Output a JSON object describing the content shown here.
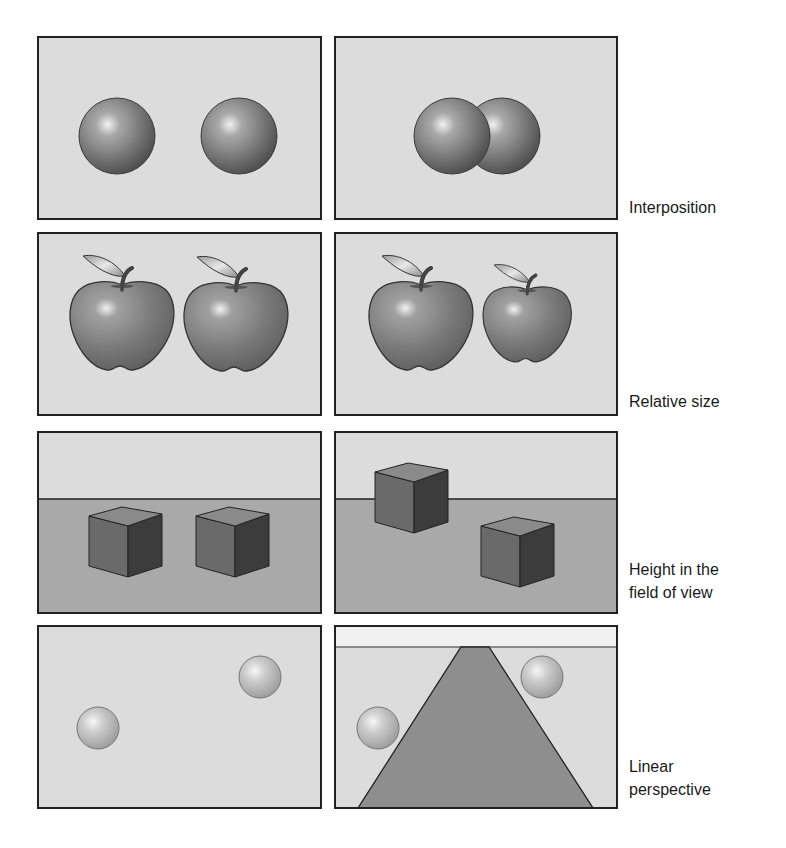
{
  "figure": {
    "colors": {
      "panel_bg": "#dcdcdc",
      "panel_border": "#222222",
      "ground": "#a9a9a9",
      "sky_strip": "#f0f0f0",
      "road": "#8e8e8e",
      "cube_top": "#8a8a8a",
      "cube_left": "#6a6a6a",
      "cube_right": "#3c3c3c",
      "label_text": "#1a1a1a"
    },
    "rows": [
      {
        "id": "interposition",
        "label_lines": [
          "Interposition"
        ],
        "left_panel": {
          "x": 38,
          "y": 37,
          "w": 283,
          "h": 182,
          "spheres": [
            {
              "cx": 117,
              "cy": 136,
              "r": 38
            },
            {
              "cx": 239,
              "cy": 136,
              "r": 38
            }
          ]
        },
        "right_panel": {
          "x": 335,
          "y": 37,
          "w": 282,
          "h": 182,
          "spheres": [
            {
              "cx": 502,
              "cy": 136,
              "r": 38
            },
            {
              "cx": 452,
              "cy": 136,
              "r": 38
            }
          ]
        }
      },
      {
        "id": "relative-size",
        "label_lines": [
          "Relative size"
        ],
        "left_panel": {
          "x": 38,
          "y": 233,
          "w": 283,
          "h": 182,
          "apples": [
            {
              "x": 70,
              "y": 256,
              "scale": 1.0
            },
            {
              "x": 184,
              "y": 257,
              "scale": 1.0
            }
          ]
        },
        "right_panel": {
          "x": 335,
          "y": 233,
          "w": 282,
          "h": 182,
          "apples": [
            {
              "x": 369,
              "y": 256,
              "scale": 1.0
            },
            {
              "x": 483,
              "y": 265,
              "scale": 0.85
            }
          ]
        }
      },
      {
        "id": "height-in-field",
        "label_lines": [
          "Height in the",
          "field of view"
        ],
        "left_panel": {
          "x": 38,
          "y": 432,
          "w": 283,
          "h": 181,
          "horizon_y": 499,
          "cubes": [
            {
              "x": 89,
              "y": 507
            },
            {
              "x": 196,
              "y": 507
            }
          ]
        },
        "right_panel": {
          "x": 335,
          "y": 432,
          "w": 282,
          "h": 181,
          "horizon_y": 499,
          "cubes": [
            {
              "x": 375,
              "y": 463
            },
            {
              "x": 481,
              "y": 517
            }
          ]
        }
      },
      {
        "id": "linear-perspective",
        "label_lines": [
          "Linear",
          "perspective"
        ],
        "left_panel": {
          "x": 38,
          "y": 626,
          "w": 283,
          "h": 182,
          "balls": [
            {
              "cx": 98,
              "cy": 728,
              "r": 21
            },
            {
              "cx": 260,
              "cy": 677,
              "r": 21
            }
          ]
        },
        "right_panel": {
          "x": 335,
          "y": 626,
          "w": 282,
          "h": 182,
          "horizon_y": 647,
          "road": [
            [
              461,
              647
            ],
            [
              489,
              647
            ],
            [
              593,
              808
            ],
            [
              358,
              808
            ]
          ],
          "balls": [
            {
              "cx": 378,
              "cy": 728,
              "r": 21
            },
            {
              "cx": 542,
              "cy": 677,
              "r": 21
            }
          ]
        }
      }
    ]
  },
  "labels": {
    "interposition": "Interposition",
    "relative_size": "Relative size",
    "height_line1": "Height in the",
    "height_line2": "field of view",
    "linear_line1": "Linear",
    "linear_line2": "perspective"
  }
}
